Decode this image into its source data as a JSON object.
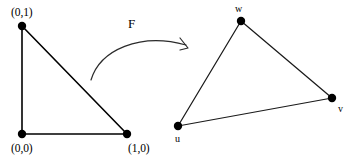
{
  "figure": {
    "background_color": "#ffffff",
    "stroke_color": "#000000"
  },
  "source_triangle": {
    "name": "standard-triangle",
    "vertices": [
      {
        "id": "origin",
        "label": "(0,0)",
        "x": 22,
        "y": 134,
        "label_x": 11,
        "label_y": 143
      },
      {
        "id": "unit-y",
        "label": "(0,1)",
        "x": 22,
        "y": 26,
        "label_x": 11,
        "label_y": 7
      },
      {
        "id": "unit-x",
        "label": "(1,0)",
        "x": 127,
        "y": 134,
        "label_x": 128,
        "label_y": 143
      }
    ],
    "edges": [
      {
        "from": "unit-y",
        "to": "origin"
      },
      {
        "from": "origin",
        "to": "unit-x"
      },
      {
        "from": "unit-x",
        "to": "unit-y"
      }
    ]
  },
  "target_triangle": {
    "name": "image-triangle",
    "vertices": [
      {
        "id": "u",
        "label": "u",
        "x": 178,
        "y": 126,
        "label_x": 175,
        "label_y": 134
      },
      {
        "id": "v",
        "label": "v",
        "x": 332,
        "y": 98,
        "label_x": 338,
        "label_y": 104
      },
      {
        "id": "w",
        "label": "w",
        "x": 241,
        "y": 21,
        "label_x": 235,
        "label_y": 4
      }
    ],
    "edges": [
      {
        "from": "u",
        "to": "w"
      },
      {
        "from": "w",
        "to": "v"
      },
      {
        "from": "v",
        "to": "u"
      }
    ]
  },
  "map_arrow": {
    "label": "F",
    "label_x": 128,
    "label_y": 17,
    "path": "M 91,80 C 100,50 140,32 186,45",
    "arrowhead": "M 180,38 L 188,48 L 180,50"
  },
  "dot_radius": 4.2
}
